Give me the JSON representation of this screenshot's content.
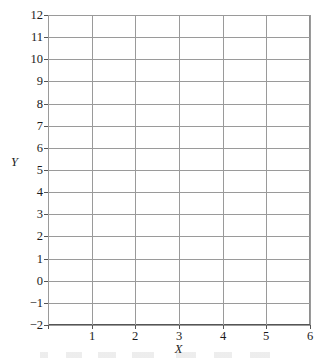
{
  "figure": {
    "title": "",
    "background_color": "#ffffff",
    "grid_color": "#9a9a9a",
    "axis_color": "#555555",
    "text_color": "#1b1b1b"
  },
  "axes": {
    "y_title": "Y",
    "x_title": "X"
  },
  "chart_data": {
    "type": "scatter",
    "title": "",
    "subtitle": "",
    "xlabel": "X",
    "ylabel": "Y",
    "xlim": [
      0,
      6
    ],
    "ylim": [
      -2,
      12
    ],
    "xticks": [
      0,
      1,
      2,
      3,
      4,
      5,
      6
    ],
    "xticklabels": [
      "",
      "1",
      "2",
      "3",
      "4",
      "5",
      "6"
    ],
    "yticks": [
      -2,
      -1,
      0,
      1,
      2,
      3,
      4,
      5,
      6,
      7,
      8,
      9,
      10,
      11,
      12
    ],
    "yticklabels": [
      "−2",
      "−1",
      "0",
      "1",
      "2",
      "3",
      "4",
      "5",
      "6",
      "7",
      "8",
      "9",
      "10",
      "11",
      "12"
    ],
    "grid": true,
    "grid_axis": "both",
    "legend": false,
    "legend_position": "none",
    "series": [],
    "x": [],
    "values": [],
    "annotations": [],
    "note": "Blank coordinate grid provided for plotting; no data points are drawn."
  }
}
